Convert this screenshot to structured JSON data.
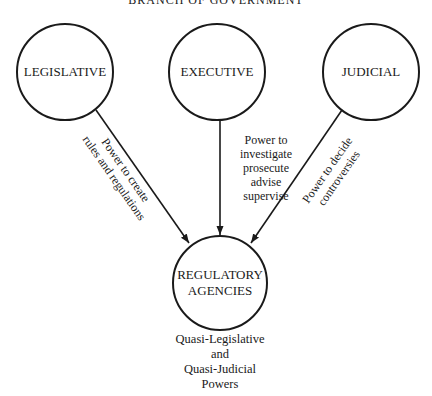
{
  "title": "BRANCH OF GOVERNMENT",
  "nodes": {
    "legislative": "LEGISLATIVE",
    "executive": "EXECUTIVE",
    "judicial": "JUDICIAL",
    "regulatory_line1": "REGULATORY",
    "regulatory_line2": "AGENCIES"
  },
  "edges": {
    "legislative": {
      "line1": "Power to create",
      "line2": "rules and regulations"
    },
    "executive": {
      "line1": "Power to",
      "line2": "investigate",
      "line3": "prosecute",
      "line4": "advise",
      "line5": "supervise"
    },
    "judicial": {
      "line1": "Power to decide",
      "line2": "controversies"
    }
  },
  "caption": {
    "line1": "Quasi-Legislative",
    "line2": "and",
    "line3": "Quasi-Judicial",
    "line4": "Powers"
  }
}
